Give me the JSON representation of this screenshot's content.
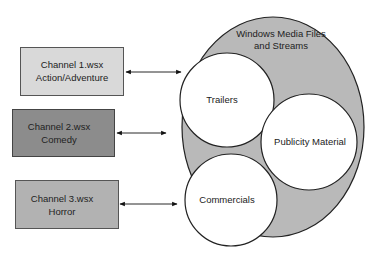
{
  "diagram": {
    "container": {
      "label_line1": "Windows Media Files",
      "label_line2": "and Streams",
      "fill": "#b9b9b9"
    },
    "channels": [
      {
        "line1": "Channel 1.wsx",
        "line2": "Action/Adventure",
        "fill": "#d9d9d9"
      },
      {
        "line1": "Channel 2.wsx",
        "line2": "Comedy",
        "fill": "#8c8c8c"
      },
      {
        "line1": "Channel 3.wsx",
        "line2": "Horror",
        "fill": "#b2b2b2"
      }
    ],
    "circles": [
      {
        "label": "Trailers"
      },
      {
        "label": "Publicity Material"
      },
      {
        "label": "Commercials"
      }
    ]
  }
}
